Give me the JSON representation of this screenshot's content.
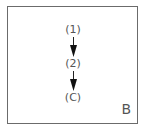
{
  "diagram": {
    "nodes": [
      {
        "label": "(1)"
      },
      {
        "label": "(2)"
      },
      {
        "label": "(C)"
      }
    ],
    "edges": [
      {
        "from": "(1)",
        "to": "(2)"
      },
      {
        "from": "(2)",
        "to": "(C)"
      }
    ],
    "panel_label": "B",
    "colors": {
      "border": "#6b6b6b",
      "text": "#555555",
      "arrow": "#111111"
    }
  }
}
